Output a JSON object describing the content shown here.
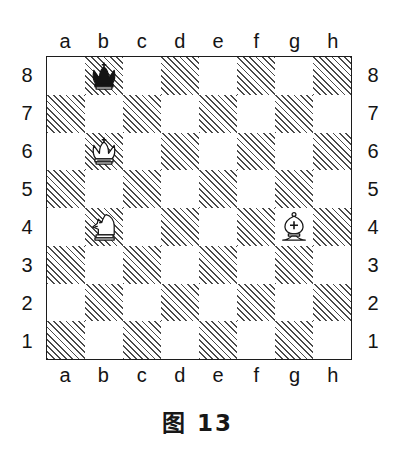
{
  "figure": {
    "caption": "图 13",
    "type": "chess-diagram"
  },
  "board": {
    "files": [
      "a",
      "b",
      "c",
      "d",
      "e",
      "f",
      "g",
      "h"
    ],
    "ranks": [
      "8",
      "7",
      "6",
      "5",
      "4",
      "3",
      "2",
      "1"
    ],
    "light_square_color": "#ffffff",
    "dark_square_fill": "hatched-diagonal",
    "dark_square_line_color": "#4a4a4a",
    "border_color": "#1c1c1c",
    "orientation": "white-bottom",
    "squares": [
      [
        "light",
        "dark",
        "light",
        "dark",
        "light",
        "dark",
        "light",
        "dark"
      ],
      [
        "dark",
        "light",
        "dark",
        "light",
        "dark",
        "light",
        "dark",
        "light"
      ],
      [
        "light",
        "dark",
        "light",
        "dark",
        "light",
        "dark",
        "light",
        "dark"
      ],
      [
        "dark",
        "light",
        "dark",
        "light",
        "dark",
        "light",
        "dark",
        "light"
      ],
      [
        "light",
        "dark",
        "light",
        "dark",
        "light",
        "dark",
        "light",
        "dark"
      ],
      [
        "dark",
        "light",
        "dark",
        "light",
        "dark",
        "light",
        "dark",
        "light"
      ],
      [
        "light",
        "dark",
        "light",
        "dark",
        "light",
        "dark",
        "light",
        "dark"
      ],
      [
        "dark",
        "light",
        "dark",
        "light",
        "dark",
        "light",
        "dark",
        "light"
      ]
    ]
  },
  "pieces": [
    {
      "square": "b8",
      "file": "b",
      "rank": "8",
      "color": "black",
      "type": "king",
      "glyph": "black-king",
      "name": "黑王"
    },
    {
      "square": "b6",
      "file": "b",
      "rank": "6",
      "color": "white",
      "type": "king",
      "glyph": "white-king",
      "name": "白王"
    },
    {
      "square": "b4",
      "file": "b",
      "rank": "4",
      "color": "white",
      "type": "knight",
      "glyph": "white-knight",
      "name": "白马"
    },
    {
      "square": "g4",
      "file": "g",
      "rank": "4",
      "color": "white",
      "type": "bishop",
      "glyph": "white-bishop",
      "name": "白象"
    }
  ]
}
